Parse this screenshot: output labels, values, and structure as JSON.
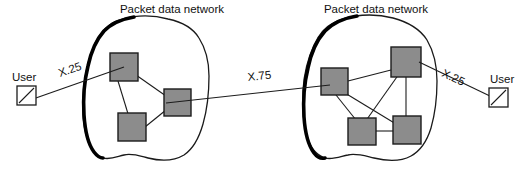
{
  "diagram": {
    "background_color": "#ffffff",
    "node_fill_color": "#8c8c8c",
    "node_stroke_color": "#1c1c1c",
    "line_color": "#1c1c1c",
    "clouds": [
      {
        "id": "left-network",
        "label": "Packet data network",
        "node_count": 3
      },
      {
        "id": "right-network",
        "label": "Packet data network",
        "node_count": 4
      }
    ],
    "endpoints": [
      {
        "id": "left-user",
        "label": "User",
        "icon": "user-terminal-icon"
      },
      {
        "id": "right-user",
        "label": "User",
        "icon": "user-terminal-icon"
      }
    ],
    "link_labels": {
      "left_access": "X.25",
      "inter_network": "X.75",
      "right_access": "X.25"
    }
  }
}
